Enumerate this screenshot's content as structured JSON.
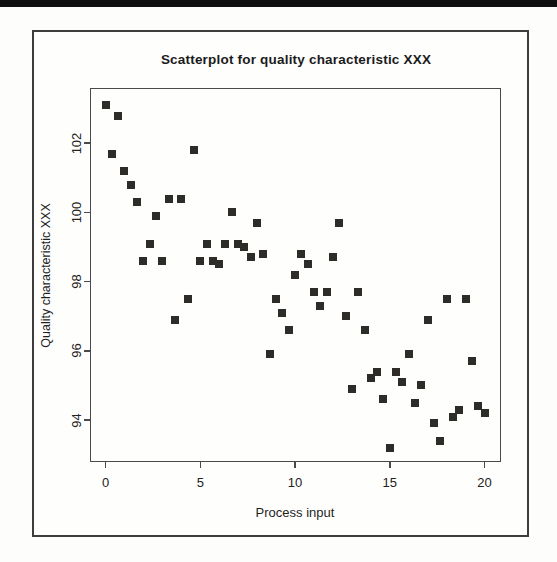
{
  "figure": {
    "top_rule_color": "#101010",
    "frame_color": "#3d3d3d",
    "point_color": "#2e2c29"
  },
  "chart_data": {
    "type": "scatter",
    "title": "Scatterplot for quality characteristic XXX",
    "xlabel": "Process input",
    "ylabel": "Quality characteristic XXX",
    "xlim": [
      -1,
      21
    ],
    "ylim": [
      93,
      103.6
    ],
    "x_ticks": [
      0,
      5,
      10,
      15,
      20
    ],
    "y_ticks": [
      94,
      96,
      98,
      100,
      102
    ],
    "grid": false,
    "legend": false,
    "marker": "filled-square",
    "points": [
      [
        0,
        103.1
      ],
      [
        0.33,
        101.7
      ],
      [
        0.67,
        102.8
      ],
      [
        1,
        101.2
      ],
      [
        1.33,
        100.8
      ],
      [
        1.67,
        100.3
      ],
      [
        2,
        98.6
      ],
      [
        2.33,
        99.1
      ],
      [
        2.67,
        99.9
      ],
      [
        3,
        98.6
      ],
      [
        3.33,
        100.4
      ],
      [
        3.67,
        96.9
      ],
      [
        4,
        100.4
      ],
      [
        4.33,
        97.5
      ],
      [
        4.67,
        101.8
      ],
      [
        5,
        98.6
      ],
      [
        5.33,
        99.1
      ],
      [
        5.67,
        98.6
      ],
      [
        6,
        98.5
      ],
      [
        6.33,
        99.1
      ],
      [
        6.67,
        100.0
      ],
      [
        7,
        99.1
      ],
      [
        7.33,
        99.0
      ],
      [
        7.67,
        98.7
      ],
      [
        8,
        99.7
      ],
      [
        8.33,
        98.8
      ],
      [
        8.67,
        95.9
      ],
      [
        9,
        97.5
      ],
      [
        9.33,
        97.1
      ],
      [
        9.67,
        96.6
      ],
      [
        10,
        98.2
      ],
      [
        10.33,
        98.8
      ],
      [
        10.67,
        98.5
      ],
      [
        11,
        97.7
      ],
      [
        11.33,
        97.3
      ],
      [
        11.67,
        97.7
      ],
      [
        12,
        98.7
      ],
      [
        12.33,
        99.7
      ],
      [
        12.67,
        97.0
      ],
      [
        13,
        94.9
      ],
      [
        13.33,
        97.7
      ],
      [
        13.67,
        96.6
      ],
      [
        14,
        95.2
      ],
      [
        14.33,
        95.4
      ],
      [
        14.67,
        94.6
      ],
      [
        15,
        93.2
      ],
      [
        15.33,
        95.4
      ],
      [
        15.67,
        95.1
      ],
      [
        16,
        95.9
      ],
      [
        16.33,
        94.5
      ],
      [
        16.67,
        95.0
      ],
      [
        17,
        96.9
      ],
      [
        17.33,
        93.9
      ],
      [
        17.67,
        93.4
      ],
      [
        18,
        97.5
      ],
      [
        18.33,
        94.1
      ],
      [
        18.67,
        94.3
      ],
      [
        19,
        97.5
      ],
      [
        19.33,
        95.7
      ],
      [
        19.67,
        94.4
      ],
      [
        20,
        94.2
      ]
    ]
  }
}
